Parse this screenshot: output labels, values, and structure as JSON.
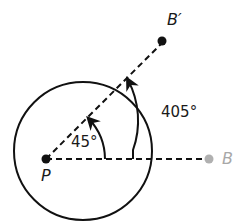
{
  "diagram": {
    "points": {
      "P": {
        "label": "P",
        "color": "#111111"
      },
      "B": {
        "label": "B",
        "color": "#b0b0b0"
      },
      "B_prime": {
        "label": "B′",
        "color": "#111111"
      }
    },
    "angles": {
      "inner": {
        "label": "45°"
      },
      "outer": {
        "label": "405°"
      }
    },
    "colors": {
      "stroke": "#111111",
      "faded": "#b0b0b0",
      "background": "#ffffff"
    }
  }
}
